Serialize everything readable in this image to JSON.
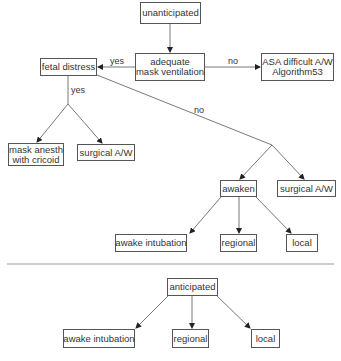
{
  "diagram": {
    "colors": {
      "line": "#555555",
      "text": "#333333",
      "separator": "#999999"
    },
    "unanticipated": {
      "root": "unanticipated",
      "decision": {
        "line1": "adequate",
        "line2": "mask ventilation"
      },
      "no_branch": {
        "line1": "ASA difficult A/W",
        "line2": "Algorithm53"
      },
      "yes_branch": "fetal distress",
      "labels": {
        "yes_left": "yes",
        "no_right": "no",
        "yes_down": "yes",
        "no_diag": "no"
      },
      "fetal_yes_children": [
        {
          "line1": "mask anesth",
          "line2": "with cricoid"
        },
        {
          "line1": "surgical A/W"
        }
      ],
      "fetal_no_children": {
        "awaken": "awaken",
        "surgical": "surgical A/W",
        "awaken_children": [
          "awake intubation",
          "regional",
          "local"
        ]
      }
    },
    "anticipated": {
      "root": "anticipated",
      "children": [
        "awake intubation",
        "regional",
        "local"
      ]
    }
  }
}
